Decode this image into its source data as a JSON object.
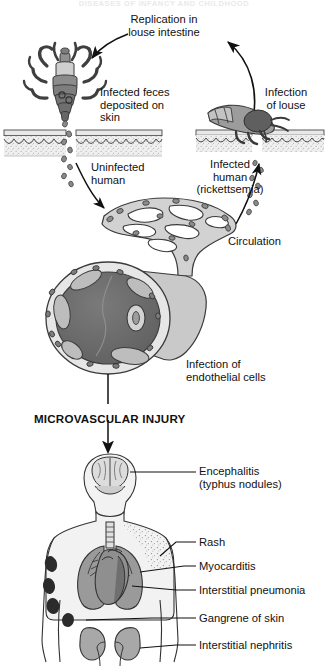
{
  "figure": {
    "header_title": "DISEASES OF INFANCY AND CHILDHOOD",
    "section_label": "MICROVASCULAR INJURY"
  },
  "cycle_labels": {
    "replication": "Replication in\nlouse intestine",
    "infection_of_louse": "Infection\nof louse",
    "infected_feces": "Infected feces\ndeposited on\nskin",
    "uninfected_human": "Uninfected\nhuman",
    "infected_human": "Infected\nhuman\n(rickettsemia)",
    "circulation": "Circulation",
    "endothelial": "Infection of\nendothelial cells"
  },
  "organ_labels": [
    {
      "id": "encephalitis",
      "text": "Encephalitis\n(typhus nodules)"
    },
    {
      "id": "rash",
      "text": "Rash"
    },
    {
      "id": "myocarditis",
      "text": "Myocarditis"
    },
    {
      "id": "interstitial-pneumonia",
      "text": "Interstitial pneumonia"
    },
    {
      "id": "gangrene",
      "text": "Gangrene of skin"
    },
    {
      "id": "nephritis",
      "text": "Interstitial nephritis"
    }
  ],
  "colors": {
    "ink": "#111111",
    "vessel_lumen": "#6b6b6b",
    "vessel_wall": "#d8d8d8",
    "tissue_light": "#e3e3e3",
    "tissue_mid": "#b4b4b4",
    "tissue_dark": "#7d7d7d",
    "louse_dark": "#4a4a4a",
    "louse_mid": "#8a8a8a",
    "body_fill": "#f2f2f2",
    "lung": "#9a9a9a",
    "heart": "#8f8f8f",
    "kidney": "#a8a8a8",
    "skin_band": "#e8e8e8",
    "background": "#ffffff"
  }
}
